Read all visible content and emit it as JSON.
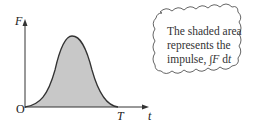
{
  "diagram": {
    "y_axis_label": "F",
    "x_axis_label": "t",
    "origin_label": "O",
    "end_label": "T",
    "curve": "bell-shaped force-time pulse from O to T",
    "fill_color": "#c8c8c8",
    "line_color": "#333333"
  },
  "callout": {
    "line1": "The shaded area",
    "line2": "represents the",
    "line3_prefix": "impulse, ",
    "integral": "∫",
    "F": "F",
    "dt_d": " d",
    "dt_t": "t"
  }
}
